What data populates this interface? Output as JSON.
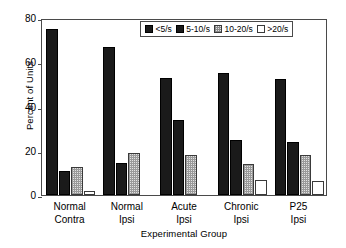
{
  "chart_data": {
    "type": "bar",
    "title": "",
    "xlabel": "Experimental Group",
    "ylabel": "Percent of Units",
    "categories": [
      "Normal Contra",
      "Normal Ipsi",
      "Acute Ipsi",
      "Chronic Ipsi",
      "P25 Ipsi"
    ],
    "category_lines": [
      [
        "Normal",
        "Contra"
      ],
      [
        "Normal",
        "Ipsi"
      ],
      [
        "Acute",
        "Ipsi"
      ],
      [
        "Chronic",
        "Ipsi"
      ],
      [
        "P25",
        "Ipsi"
      ]
    ],
    "series": [
      {
        "name": "<5/s",
        "values": [
          75,
          67,
          53,
          55,
          52.5
        ]
      },
      {
        "name": "5-10/s",
        "values": [
          11,
          14.5,
          34,
          25,
          24
        ]
      },
      {
        "name": "10-20/s",
        "values": [
          12.5,
          19,
          18,
          14,
          18
        ]
      },
      {
        "name": ">20/s",
        "values": [
          2,
          0,
          0,
          7,
          6.5
        ]
      }
    ],
    "ylim": [
      0,
      80
    ],
    "yticks": [
      0,
      20,
      40,
      60,
      80
    ],
    "ytick_labels": [
      "0",
      "20",
      "40",
      "60",
      "80"
    ],
    "grid": false,
    "legend_position": "top-center-inside",
    "legend_entries": [
      "<5/s",
      "5-10/s",
      "10-20/s",
      ">20/s"
    ],
    "colors": {
      "series_0": "#1a1a1a",
      "series_1": "#1a1a1a",
      "series_2": "#e2e2e2",
      "series_3": "#ffffff",
      "axis": "#4a4a4a",
      "text": "#000000"
    }
  }
}
